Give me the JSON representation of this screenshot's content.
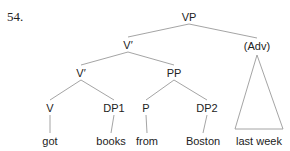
{
  "example_number": "54.",
  "tree": {
    "nodes": [
      {
        "id": "vp",
        "label": "VP"
      },
      {
        "id": "vbar1",
        "label": "V′"
      },
      {
        "id": "adv",
        "label": "(Adv)"
      },
      {
        "id": "vbar2",
        "label": "V′"
      },
      {
        "id": "pp",
        "label": "PP"
      },
      {
        "id": "v",
        "label": "V"
      },
      {
        "id": "dp1",
        "label": "DP1"
      },
      {
        "id": "p",
        "label": "P"
      },
      {
        "id": "dp2",
        "label": "DP2"
      },
      {
        "id": "got",
        "label": "got"
      },
      {
        "id": "books",
        "label": "books"
      },
      {
        "id": "from",
        "label": "from"
      },
      {
        "id": "boston",
        "label": "Boston"
      },
      {
        "id": "lastweek",
        "label": "last week"
      }
    ],
    "edges": [
      [
        "vp",
        "vbar1"
      ],
      [
        "vp",
        "adv"
      ],
      [
        "vbar1",
        "vbar2"
      ],
      [
        "vbar1",
        "pp"
      ],
      [
        "vbar2",
        "v"
      ],
      [
        "vbar2",
        "dp1"
      ],
      [
        "pp",
        "p"
      ],
      [
        "pp",
        "dp2"
      ],
      [
        "v",
        "got"
      ],
      [
        "dp1",
        "books"
      ],
      [
        "p",
        "from"
      ],
      [
        "dp2",
        "boston"
      ]
    ],
    "triangles": [
      {
        "parent": "adv",
        "covers": "lastweek"
      }
    ]
  }
}
